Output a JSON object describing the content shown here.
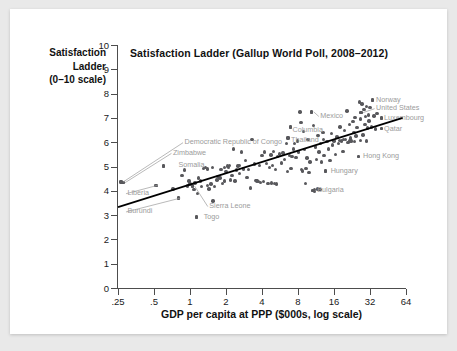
{
  "figure": {
    "background_color": "#ffffff",
    "page_background_color": "#e9e9e9",
    "dot_color": "#58585c",
    "annotation_color": "#9b9b9b",
    "axis_color": "#4d4d4d",
    "trendline_color": "#000000"
  },
  "chart_data": {
    "type": "scatter",
    "title": "Satisfaction Ladder (Gallup World Poll, 2008–2012)",
    "ylabel": "Satisfaction Ladder (0–10 scale)",
    "ylabel_lines": [
      "Satisfaction",
      "Ladder",
      "(0–10 scale)"
    ],
    "xlabel": "GDP per capita at PPP ($000s, log scale)",
    "xscale": "log2",
    "xlim": [
      0.25,
      64
    ],
    "ylim": [
      0,
      10
    ],
    "grid": false,
    "legend": null,
    "xticks": [
      0.25,
      0.5,
      1,
      2,
      4,
      8,
      16,
      32,
      64
    ],
    "xtick_labels": [
      ".25",
      ".5",
      "1",
      "2",
      "4",
      "8",
      "16",
      "32",
      "64"
    ],
    "yticks": [
      0,
      1,
      2,
      3,
      4,
      5,
      6,
      7,
      8,
      9,
      10
    ],
    "ytick_labels": [
      "0",
      "1",
      "2",
      "3",
      "4",
      "5",
      "6",
      "7",
      "8",
      "9",
      "10"
    ],
    "trendline": {
      "label": "fitted regression line",
      "x0": 0.25,
      "y0": 3.33,
      "x1": 60.0,
      "y1": 7.0
    },
    "annotations": [
      {
        "text": "Democratic Republic of Congo",
        "x": 0.9,
        "y": 6.0,
        "align": "left",
        "point_x": 0.265,
        "point_y": 4.36,
        "leader": true
      },
      {
        "text": "Zimbabwe",
        "x": 0.72,
        "y": 5.56,
        "align": "left",
        "point_x": 0.275,
        "point_y": 4.33,
        "leader": true
      },
      {
        "text": "Somalia",
        "x": 0.8,
        "y": 5.05,
        "align": "left",
        "point_x": 0.6,
        "point_y": 5.02,
        "leader": false
      },
      {
        "text": "Liberia",
        "x": 0.3,
        "y": 3.9,
        "align": "left",
        "point_x": 0.52,
        "point_y": 4.23,
        "leader": true
      },
      {
        "text": "Burundi",
        "x": 0.3,
        "y": 3.15,
        "align": "left",
        "point_x": 0.8,
        "point_y": 3.7,
        "leader": true
      },
      {
        "text": "Sierra Leone",
        "x": 1.45,
        "y": 3.37,
        "align": "left",
        "point_x": 1.05,
        "point_y": 4.2,
        "leader": true
      },
      {
        "text": "Togo",
        "x": 1.3,
        "y": 2.93,
        "align": "left",
        "point_x": 1.13,
        "point_y": 2.93,
        "leader": false
      },
      {
        "text": "Thailand",
        "x": 7.0,
        "y": 6.07,
        "align": "left",
        "point_x": 6.6,
        "point_y": 6.18,
        "leader": false
      },
      {
        "text": "Columbia",
        "x": 7.2,
        "y": 6.52,
        "align": "left",
        "point_x": 6.9,
        "point_y": 6.62,
        "leader": false
      },
      {
        "text": "Mexico",
        "x": 12.3,
        "y": 7.08,
        "align": "left",
        "point_x": 10.4,
        "point_y": 7.25,
        "leader": true
      },
      {
        "text": "Norway",
        "x": 36.0,
        "y": 7.73,
        "align": "left",
        "point_x": 33.5,
        "point_y": 7.73,
        "leader": false
      },
      {
        "text": "United States",
        "x": 36.0,
        "y": 7.4,
        "align": "left",
        "point_x": 27.0,
        "point_y": 7.22,
        "leader": true
      },
      {
        "text": "Luxembourg",
        "x": 42.0,
        "y": 7.0,
        "align": "left",
        "point_x": 40.0,
        "point_y": 7.0,
        "leader": false
      },
      {
        "text": "Qatar",
        "x": 42.0,
        "y": 6.56,
        "align": "left",
        "point_x": 40.0,
        "point_y": 6.56,
        "leader": false
      },
      {
        "text": "Hong Kong",
        "x": 28.0,
        "y": 5.42,
        "align": "left",
        "point_x": 25.5,
        "point_y": 5.42,
        "leader": false
      },
      {
        "text": "Hungary",
        "x": 15.0,
        "y": 4.82,
        "align": "left",
        "point_x": 13.6,
        "point_y": 4.82,
        "leader": false
      },
      {
        "text": "Bulgaria",
        "x": 11.6,
        "y": 4.02,
        "align": "left",
        "point_x": 10.6,
        "point_y": 4.02,
        "leader": false
      }
    ],
    "points": [
      [
        0.265,
        4.36
      ],
      [
        0.275,
        4.33
      ],
      [
        0.52,
        4.23
      ],
      [
        0.6,
        5.02
      ],
      [
        0.72,
        4.07
      ],
      [
        0.8,
        3.7
      ],
      [
        0.86,
        4.62
      ],
      [
        0.9,
        4.85
      ],
      [
        0.95,
        4.2
      ],
      [
        1.0,
        4.28
      ],
      [
        1.05,
        4.2
      ],
      [
        1.08,
        4.05
      ],
      [
        1.1,
        4.32
      ],
      [
        1.13,
        2.93
      ],
      [
        1.16,
        3.88
      ],
      [
        1.22,
        4.4
      ],
      [
        1.25,
        4.18
      ],
      [
        1.3,
        4.92
      ],
      [
        1.34,
        4.95
      ],
      [
        1.4,
        4.22
      ],
      [
        1.44,
        4.08
      ],
      [
        1.5,
        4.28
      ],
      [
        1.56,
        3.58
      ],
      [
        1.6,
        4.18
      ],
      [
        1.68,
        4.45
      ],
      [
        1.72,
        4.6
      ],
      [
        1.78,
        4.52
      ],
      [
        1.82,
        4.88
      ],
      [
        1.88,
        4.3
      ],
      [
        1.95,
        4.4
      ],
      [
        2.0,
        4.8
      ],
      [
        2.05,
        5.02
      ],
      [
        2.1,
        4.95
      ],
      [
        2.18,
        4.45
      ],
      [
        2.25,
        4.62
      ],
      [
        2.32,
        5.72
      ],
      [
        2.38,
        4.4
      ],
      [
        2.45,
        4.85
      ],
      [
        2.52,
        5.02
      ],
      [
        2.6,
        4.7
      ],
      [
        2.7,
        5.6
      ],
      [
        2.8,
        4.9
      ],
      [
        2.9,
        5.25
      ],
      [
        3.0,
        4.55
      ],
      [
        3.1,
        4.88
      ],
      [
        3.2,
        4.12
      ],
      [
        3.3,
        6.12
      ],
      [
        3.45,
        5.1
      ],
      [
        3.55,
        4.42
      ],
      [
        3.62,
        4.4
      ],
      [
        3.75,
        4.38
      ],
      [
        3.9,
        4.35
      ],
      [
        4.0,
        5.45
      ],
      [
        4.1,
        4.38
      ],
      [
        4.2,
        5.6
      ],
      [
        4.35,
        5.12
      ],
      [
        4.5,
        4.3
      ],
      [
        4.6,
        4.95
      ],
      [
        4.75,
        5.48
      ],
      [
        4.9,
        5.05
      ],
      [
        5.0,
        5.62
      ],
      [
        5.2,
        4.88
      ],
      [
        5.4,
        5.42
      ],
      [
        5.6,
        5.52
      ],
      [
        5.8,
        5.15
      ],
      [
        6.0,
        5.55
      ],
      [
        6.2,
        5.3
      ],
      [
        6.4,
        5.95
      ],
      [
        6.6,
        6.18
      ],
      [
        6.8,
        5.45
      ],
      [
        6.9,
        6.62
      ],
      [
        7.1,
        5.4
      ],
      [
        7.3,
        5.72
      ],
      [
        7.5,
        5.95
      ],
      [
        7.7,
        5.38
      ],
      [
        7.9,
        6.05
      ],
      [
        8.1,
        5.6
      ],
      [
        8.3,
        7.25
      ],
      [
        8.5,
        6.8
      ],
      [
        8.7,
        4.82
      ],
      [
        8.9,
        6.45
      ],
      [
        9.1,
        5.7
      ],
      [
        9.3,
        4.92
      ],
      [
        9.5,
        5.35
      ],
      [
        9.7,
        6.1
      ],
      [
        9.9,
        4.75
      ],
      [
        10.1,
        5.18
      ],
      [
        10.4,
        7.25
      ],
      [
        10.6,
        4.02
      ],
      [
        10.8,
        6.7
      ],
      [
        11.0,
        4.05
      ],
      [
        11.2,
        5.8
      ],
      [
        11.4,
        5.3
      ],
      [
        11.6,
        4.08
      ],
      [
        11.8,
        6.28
      ],
      [
        12.0,
        5.6
      ],
      [
        12.3,
        5.95
      ],
      [
        12.6,
        5.18
      ],
      [
        12.9,
        6.4
      ],
      [
        13.2,
        5.45
      ],
      [
        13.6,
        4.82
      ],
      [
        14.0,
        6.02
      ],
      [
        14.4,
        5.72
      ],
      [
        14.8,
        5.25
      ],
      [
        15.2,
        6.35
      ],
      [
        15.6,
        5.88
      ],
      [
        16.0,
        6.05
      ],
      [
        16.5,
        5.5
      ],
      [
        17.0,
        6.22
      ],
      [
        17.5,
        5.95
      ],
      [
        18.0,
        6.62
      ],
      [
        18.5,
        6.05
      ],
      [
        19.0,
        5.62
      ],
      [
        19.5,
        6.48
      ],
      [
        20.0,
        6.1
      ],
      [
        20.5,
        7.28
      ],
      [
        21.0,
        5.98
      ],
      [
        21.5,
        6.72
      ],
      [
        22.0,
        6.18
      ],
      [
        22.5,
        6.05
      ],
      [
        23.0,
        6.85
      ],
      [
        23.5,
        6.4
      ],
      [
        24.0,
        7.02
      ],
      [
        24.5,
        6.25
      ],
      [
        25.0,
        6.6
      ],
      [
        25.5,
        5.42
      ],
      [
        26.0,
        7.65
      ],
      [
        26.5,
        6.95
      ],
      [
        27.0,
        7.22
      ],
      [
        27.5,
        7.58
      ],
      [
        28.0,
        6.3
      ],
      [
        28.5,
        7.35
      ],
      [
        29.0,
        6.72
      ],
      [
        29.5,
        7.05
      ],
      [
        30.0,
        7.48
      ],
      [
        30.5,
        6.58
      ],
      [
        31.0,
        7.12
      ],
      [
        31.5,
        6.88
      ],
      [
        32.0,
        7.42
      ],
      [
        33.0,
        6.62
      ],
      [
        33.5,
        7.73
      ],
      [
        34.5,
        7.08
      ],
      [
        35.5,
        6.55
      ],
      [
        36.5,
        7.18
      ],
      [
        40.0,
        7.0
      ],
      [
        40.0,
        6.56
      ],
      [
        2.15,
        5.05
      ],
      [
        2.6,
        5.05
      ],
      [
        3.8,
        5.05
      ],
      [
        1.95,
        4.95
      ],
      [
        5.1,
        4.3
      ],
      [
        5.3,
        4.28
      ],
      [
        4.8,
        4.32
      ],
      [
        12.2,
        4.05
      ],
      [
        11.0,
        3.98
      ],
      [
        9.2,
        4.3
      ],
      [
        8.6,
        4.88
      ],
      [
        7.0,
        4.92
      ],
      [
        6.5,
        4.8
      ],
      [
        13.0,
        6.1
      ],
      [
        17.8,
        6.08
      ],
      [
        19.2,
        6.1
      ],
      [
        21.8,
        6.05
      ],
      [
        23.8,
        6.02
      ],
      [
        26.8,
        6.08
      ],
      [
        29.8,
        6.05
      ],
      [
        1.4,
        4.9
      ],
      [
        1.55,
        4.95
      ],
      [
        0.98,
        4.4
      ],
      [
        1.18,
        4.52
      ]
    ]
  }
}
